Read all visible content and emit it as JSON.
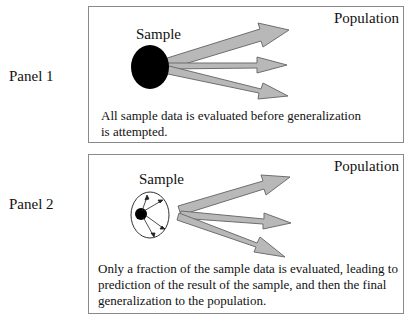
{
  "panels": [
    {
      "label": "Panel 1",
      "population": "Population",
      "sample": "Sample",
      "caption_line1": "All sample data is evaluated before generalization",
      "caption_line2": "is attempted."
    },
    {
      "label": "Panel 2",
      "population": "Population",
      "sample": "Sample",
      "caption_line1": "Only a fraction of the sample data is evaluated, leading to",
      "caption_line2": "prediction of the result of the sample, and then the final",
      "caption_line3": "generalization to the population."
    }
  ],
  "colors": {
    "arrow_fill": "#b8b8b8",
    "arrow_stroke": "#6e6e6e",
    "border": "#8a8a8a"
  }
}
